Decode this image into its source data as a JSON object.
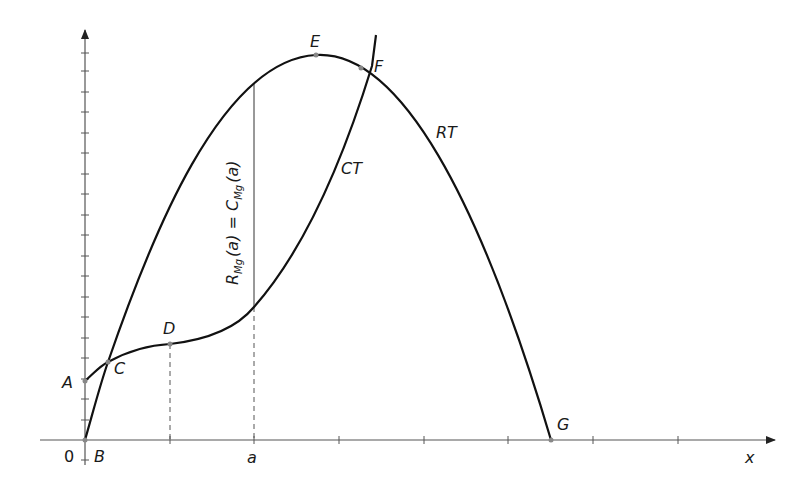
{
  "diagram": {
    "type": "economics-total-revenue-total-cost",
    "axes": {
      "x_label": "x",
      "origin_label": "0",
      "x_tick_label_a": "a"
    },
    "curves": [
      {
        "name": "RT",
        "label": "RT",
        "description": "Total revenue, concave parabola from B (origin) peaking at E, crossing x-axis at G"
      },
      {
        "name": "CT",
        "label": "CT",
        "description": "Total cost, starts at A on y-axis, inflection at D, rising steeply through F"
      }
    ],
    "points": {
      "A": "A",
      "B": "B",
      "C": "C",
      "D": "D",
      "E": "E",
      "F": "F",
      "G": "G"
    },
    "annotation": {
      "main_R": "R",
      "sub_R": "Mg",
      "arg_R": "(a) = ",
      "main_C": "C",
      "sub_C": "Mg",
      "arg_C": "(a)"
    },
    "colors": {
      "curve": "#111111",
      "axis": "#555555",
      "point": "#888888"
    }
  }
}
